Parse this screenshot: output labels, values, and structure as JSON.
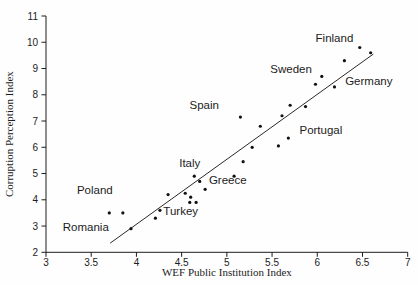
{
  "figure": {
    "background": "#fefefe",
    "ink_color": "#1c1c1c",
    "point_color": "#111111",
    "line_color": "#2a2a2a"
  },
  "chart_data": {
    "type": "scatter",
    "title": "",
    "xlabel": "WEF Public Institution Index",
    "ylabel": "Corruption Perception Index",
    "xlim": [
      3,
      7
    ],
    "ylim": [
      2,
      11
    ],
    "grid": false,
    "legend": false,
    "x_ticks": [
      {
        "value": 3,
        "label": "3"
      },
      {
        "value": 3.5,
        "label": "3.5"
      },
      {
        "value": 4,
        "label": "4"
      },
      {
        "value": 4.5,
        "label": "4.5"
      },
      {
        "value": 5,
        "label": "5"
      },
      {
        "value": 5.5,
        "label": "5.5"
      },
      {
        "value": 6,
        "label": "6"
      },
      {
        "value": 6.5,
        "label": "6.5"
      },
      {
        "value": 7,
        "label": "7"
      }
    ],
    "y_ticks": [
      {
        "value": 2,
        "label": "2"
      },
      {
        "value": 3,
        "label": "3"
      },
      {
        "value": 4,
        "label": "4"
      },
      {
        "value": 5,
        "label": "5"
      },
      {
        "value": 6,
        "label": "6"
      },
      {
        "value": 7,
        "label": "7"
      },
      {
        "value": 8,
        "label": "8"
      },
      {
        "value": 9,
        "label": "9"
      },
      {
        "value": 10,
        "label": "10"
      },
      {
        "value": 11,
        "label": "11"
      }
    ],
    "points": [
      [
        3.7,
        3.5
      ],
      [
        3.85,
        3.5
      ],
      [
        3.94,
        2.9
      ],
      [
        4.21,
        3.3
      ],
      [
        4.26,
        3.6
      ],
      [
        4.35,
        4.2
      ],
      [
        4.54,
        4.25
      ],
      [
        4.59,
        3.9
      ],
      [
        4.6,
        4.1
      ],
      [
        4.64,
        4.9
      ],
      [
        4.66,
        3.9
      ],
      [
        4.7,
        4.7
      ],
      [
        4.76,
        4.4
      ],
      [
        5.08,
        4.9
      ],
      [
        5.15,
        7.15
      ],
      [
        5.18,
        5.45
      ],
      [
        5.28,
        6.0
      ],
      [
        5.37,
        6.8
      ],
      [
        5.57,
        6.05
      ],
      [
        5.61,
        7.2
      ],
      [
        5.68,
        6.35
      ],
      [
        5.7,
        7.6
      ],
      [
        5.87,
        7.55
      ],
      [
        5.98,
        8.4
      ],
      [
        6.05,
        8.7
      ],
      [
        6.19,
        8.3
      ],
      [
        6.3,
        9.3
      ],
      [
        6.47,
        9.8
      ],
      [
        6.59,
        9.6
      ]
    ],
    "annotations": [
      {
        "text": "Poland",
        "x": 3.54,
        "y": 4.37
      },
      {
        "text": "Romania",
        "x": 3.44,
        "y": 2.98
      },
      {
        "text": "Turkey",
        "x": 4.49,
        "y": 3.56
      },
      {
        "text": "Italy",
        "x": 4.59,
        "y": 5.41
      },
      {
        "text": "Greece",
        "x": 5.01,
        "y": 4.74
      },
      {
        "text": "Spain",
        "x": 4.75,
        "y": 7.63
      },
      {
        "text": "Portugal",
        "x": 6.04,
        "y": 6.66
      },
      {
        "text": "Sweden",
        "x": 5.71,
        "y": 8.98
      },
      {
        "text": "Finland",
        "x": 6.19,
        "y": 10.16
      },
      {
        "text": "Germany",
        "x": 6.57,
        "y": 8.53
      }
    ],
    "trend_line": {
      "x1": 3.71,
      "y1": 2.35,
      "x2": 6.62,
      "y2": 9.55
    }
  }
}
